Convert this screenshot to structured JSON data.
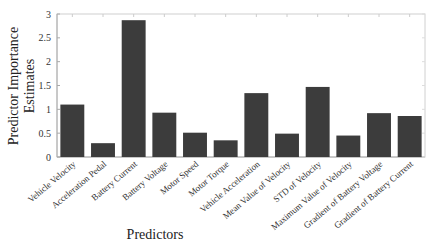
{
  "chart_data": {
    "type": "bar",
    "title": "",
    "xlabel": "Predictors",
    "ylabel": [
      "Predictor Importance",
      "Estimates"
    ],
    "ylim": [
      0,
      3
    ],
    "yticks": [
      0,
      0.5,
      1,
      1.5,
      2,
      2.5,
      3
    ],
    "ytick_labels": [
      "0",
      "0.5",
      "1",
      "1.5",
      "2",
      "2.5",
      "3"
    ],
    "grid": false,
    "legend": null,
    "bar_color": "#3c3c3c",
    "categories": [
      "Vehicle Velocity",
      "Acceleration Pedal",
      "Battery Current",
      "Battery Voltage",
      "Motor Speed",
      "Motor Torque",
      "Vehicle Acceleration",
      "Mean Value of Velocity",
      "STD of Velocity",
      "Maximum Value of Velocity",
      "Gradient of Battery Voltage",
      "Gradient of Battery Current"
    ],
    "values": [
      1.1,
      0.29,
      2.87,
      0.93,
      0.51,
      0.35,
      1.34,
      0.49,
      1.47,
      0.45,
      0.92,
      0.86
    ]
  }
}
